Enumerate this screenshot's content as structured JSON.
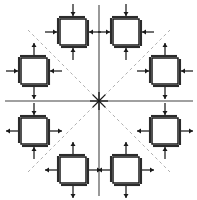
{
  "figure": {
    "type": "stress-element-diagram",
    "width": 197,
    "height": 200,
    "background_color": "#ffffff",
    "title": "",
    "caption": ""
  },
  "colors": {
    "axis_line": "#808080",
    "diagonal_dashed": "#b0b0b0",
    "element_stroke": "#1a1a1a",
    "element_shadow": "#2b2b2b",
    "element_fill": "#ffffff",
    "arrow": "#1a1a1a",
    "center_star": "#1a1a1a"
  },
  "axes": {
    "center": {
      "x": 99,
      "y": 101
    },
    "horizontal": {
      "x1": 5,
      "y1": 101,
      "x2": 193,
      "y2": 101,
      "style": "solid",
      "width": 1.6
    },
    "vertical": {
      "x1": 99,
      "y1": 5,
      "x2": 99,
      "y2": 196,
      "style": "solid",
      "width": 1.6
    },
    "diagonal_down_right": {
      "x1": 28,
      "y1": 30,
      "x2": 170,
      "y2": 172,
      "style": "dashed",
      "width": 1
    },
    "diagonal_up_right": {
      "x1": 28,
      "y1": 172,
      "x2": 170,
      "y2": 30,
      "style": "dashed",
      "width": 1
    },
    "dash_pattern": "3,3"
  },
  "center_marker": {
    "name": "center-star",
    "rays": 8,
    "radius": 9
  },
  "element_geometry": {
    "square_size": 26,
    "shadow_offset": 2,
    "arrow_gap": 3,
    "arrow_length": 12,
    "arrow_head": 4
  },
  "elements": [
    {
      "id": "element-top-left-inner",
      "label": "top-left-inner",
      "quadrant": "top-left",
      "cx": 73,
      "cy": 32,
      "arrows": {
        "top": "inward",
        "right": "inward",
        "bottom": "inward",
        "left": "inward"
      },
      "state": "biaxial-compression"
    },
    {
      "id": "element-top-left-outer",
      "label": "top-left-outer",
      "quadrant": "top-left",
      "cx": 34,
      "cy": 71,
      "arrows": {
        "top": "outward",
        "right": "inward",
        "bottom": "outward",
        "left": "inward"
      },
      "state": "horizontal-compression-vertical-tension"
    },
    {
      "id": "element-top-right-inner",
      "label": "top-right-inner",
      "quadrant": "top-right",
      "cx": 126,
      "cy": 32,
      "arrows": {
        "top": "inward",
        "right": "inward",
        "bottom": "inward",
        "left": "inward"
      },
      "state": "biaxial-compression"
    },
    {
      "id": "element-top-right-outer",
      "label": "top-right-outer",
      "quadrant": "top-right",
      "cx": 165,
      "cy": 71,
      "arrows": {
        "top": "outward",
        "right": "inward",
        "bottom": "outward",
        "left": "inward"
      },
      "state": "horizontal-compression-vertical-tension"
    },
    {
      "id": "element-bottom-left-outer",
      "label": "bottom-left-outer",
      "quadrant": "bottom-left",
      "cx": 34,
      "cy": 131,
      "arrows": {
        "top": "inward",
        "right": "outward",
        "bottom": "inward",
        "left": "outward"
      },
      "state": "horizontal-tension-vertical-compression"
    },
    {
      "id": "element-bottom-left-inner",
      "label": "bottom-left-inner",
      "quadrant": "bottom-left",
      "cx": 73,
      "cy": 170,
      "arrows": {
        "top": "outward",
        "right": "outward",
        "bottom": "outward",
        "left": "outward"
      },
      "state": "biaxial-tension"
    },
    {
      "id": "element-bottom-right-outer",
      "label": "bottom-right-outer",
      "quadrant": "bottom-right",
      "cx": 165,
      "cy": 131,
      "arrows": {
        "top": "inward",
        "right": "outward",
        "bottom": "inward",
        "left": "outward"
      },
      "state": "horizontal-tension-vertical-compression"
    },
    {
      "id": "element-bottom-right-inner",
      "label": "bottom-right-inner",
      "quadrant": "bottom-right",
      "cx": 126,
      "cy": 170,
      "arrows": {
        "top": "outward",
        "right": "outward",
        "bottom": "outward",
        "left": "outward"
      },
      "state": "biaxial-tension"
    }
  ]
}
